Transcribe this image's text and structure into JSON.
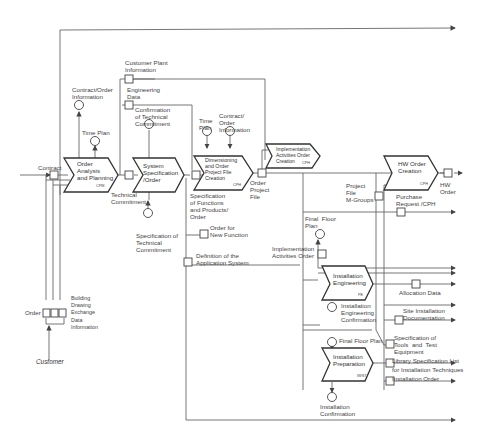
{
  "diagram": {
    "type": "event-driven process chain (function/information flow)",
    "functions": [
      {
        "id": "f1",
        "label": "Order\nAnalysis\nand Planning",
        "org": "CPM"
      },
      {
        "id": "f2",
        "label": "System\nSpecification\n/Order",
        "org": ""
      },
      {
        "id": "f3",
        "label": "Dimensioning\nand Order\nProject File\nCreation",
        "org": "CPH"
      },
      {
        "id": "f4",
        "label": "Implementation\nActivities Order\nCreation",
        "org": "CPH"
      },
      {
        "id": "f5",
        "label": "HW Order\nCreation",
        "org": "CPH"
      },
      {
        "id": "f6",
        "label": "Installation\nEngineering",
        "org": "PE"
      },
      {
        "id": "f7",
        "label": "Installation\nPreparation",
        "org": "IWST"
      }
    ],
    "external": {
      "customer": "Customer"
    },
    "data_labels": {
      "contract": "Contract",
      "order": "Order",
      "building": "Building\nDrawing\nExchange\nData\nInformation",
      "contract_order_info": "Contract/Order\nInformation",
      "time_plan_1": "Time Plan",
      "customer_plant": "Customer Plant\nInformation",
      "engineering_data": "Engineering\nData",
      "confirmation": "Confirmation\nof Technical\nCommitment",
      "technical_commitment": "Technical\nCommitment",
      "spec_tech_commitment": "Specification of\nTechnical\nCommitment",
      "time_plan_2": "Time\nPlan",
      "contract_order_info_2": "Contract/\nOrder\nInformation",
      "spec_functions": "Specification\nof Functions\nand Products/\nOrder",
      "order_project_file": "Order\nProject\nFile",
      "order_new_function": "Order for\nNew Function",
      "definition_app": "Definition of the\nApplication System",
      "project_file_mgroups": "Project\nFile\nM-Groups",
      "hw_order": "HW\nOrder",
      "purchase_request": "Purchase\nRequest /CPH",
      "final_floor_plan_1": "Final  Floor\nPlan",
      "impl_activities_order": "Implementation\nActivities Order",
      "allocation_data": "Allocation Data",
      "install_eng_confirmation": "Installation\nEngineering\nConfirmation",
      "site_install_doc": "Site Installation\nDocumentation",
      "final_floor_plan_2": "Final Floor Plan",
      "spec_tools": "Specification of\nTools  and  Test\nEquipment",
      "library_spec": "Library Specification List",
      "install_techniques": "for Installation Techniques",
      "installation_order": "Installation Order",
      "installation_confirmation": "Installation\nConfirmation"
    },
    "colors": {
      "line": "#555555",
      "text": "#333333",
      "background": "#ffffff"
    }
  }
}
